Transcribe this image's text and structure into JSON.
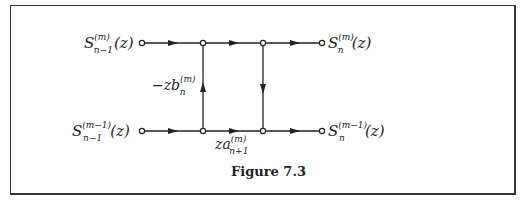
{
  "figure": {
    "caption": "Figure 7.3",
    "colors": {
      "line": "#222222",
      "border": "#333333",
      "background": "#ffffff"
    }
  },
  "nodes": {
    "input_top": {
      "label_base": "S",
      "sup": "(m)",
      "sub": "n−1",
      "arg": "(z)"
    },
    "input_bottom": {
      "label_base": "S",
      "sup": "(m−1)",
      "sub": "n−1",
      "arg": "(z)"
    },
    "output_top": {
      "label_base": "S",
      "sup": "(m)",
      "sub": "n",
      "arg": "(z)"
    },
    "output_bottom": {
      "label_base": "S",
      "sup": "(m−1)",
      "sub": "n",
      "arg": "(z)"
    }
  },
  "branches": {
    "left_vertical": {
      "base": "−zb",
      "sup": "(m)",
      "sub": "n",
      "direction": "up"
    },
    "bottom_middle": {
      "base": "za",
      "sup": "(m)",
      "sub": "n+1",
      "direction": "right"
    },
    "right_vertical": {
      "direction": "down"
    }
  }
}
